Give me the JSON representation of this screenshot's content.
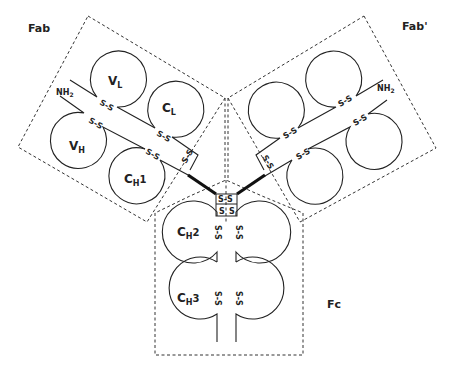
{
  "diagram": {
    "regions": [
      {
        "id": "fab",
        "label": "Fab"
      },
      {
        "id": "fab_prime",
        "label": "Fab'"
      },
      {
        "id": "fc",
        "label": "Fc"
      }
    ],
    "domains": {
      "vl": {
        "main": "V",
        "sub": "L"
      },
      "cl": {
        "main": "C",
        "sub": "L"
      },
      "vh": {
        "main": "V",
        "sub": "H"
      },
      "ch1": {
        "main": "C",
        "sub": "H",
        "suffix": "1"
      },
      "ch2": {
        "main": "C",
        "sub": "H",
        "suffix": "2"
      },
      "ch3": {
        "main": "C",
        "sub": "H",
        "suffix": "3"
      }
    },
    "terminus": {
      "main": "NH",
      "sub": "2"
    },
    "disulfide_label": "S-S",
    "disulfide_short": "S",
    "colors": {
      "line": "#222222",
      "background": "#ffffff"
    }
  }
}
